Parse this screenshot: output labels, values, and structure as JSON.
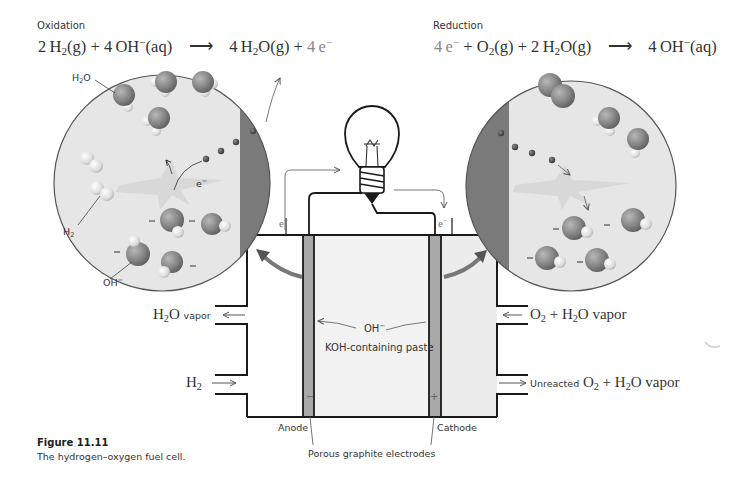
{
  "figure": {
    "number": "Figure 11.11",
    "caption": "The hydrogen–oxygen fuel cell."
  },
  "oxidation": {
    "label": "Oxidation",
    "equation": {
      "reactants": [
        "2 H₂(g)",
        "4 OH⁻(aq)"
      ],
      "products": [
        "4 H₂O(g)",
        "4 e⁻"
      ],
      "arrow": "⟶"
    }
  },
  "reduction": {
    "label": "Reduction",
    "equation": {
      "reactants": [
        "4 e⁻",
        "O₂(g)",
        "2 H₂O(g)"
      ],
      "products": [
        "4 OH⁻(aq)"
      ],
      "arrow": "⟶"
    }
  },
  "anode_zoom": {
    "labels": {
      "water": "H2O",
      "hydrogen": "H2",
      "hydroxide": "OH−",
      "electron": "e−"
    }
  },
  "cathode_zoom": {
    "labels": {}
  },
  "cell": {
    "paste_label": "KOH-containing paste",
    "ion_label": "OH−",
    "anode_label": "Anode",
    "cathode_label": "Cathode",
    "electrodes_label": "Porous graphite electrodes",
    "anode_sign": "−",
    "cathode_sign": "+",
    "electron_left": "e−",
    "electron_right": "e−",
    "left_outlet": {
      "formula": "H2O",
      "suffix": "vapor"
    },
    "left_inlet": {
      "formula": "H2"
    },
    "right_inlet": {
      "text": "O2 + H2O vapor"
    },
    "right_outlet": {
      "prefix": "Unreacted",
      "text": "O2 + H2O vapor"
    }
  },
  "colors": {
    "electrode": "#a9a9a9",
    "paste": "#f1f1f1",
    "cathode_chamber": "#ececec",
    "circle_fill": "#e6e6e6",
    "circle_electrode": "#7a7a7a",
    "oxygen_atom": "#8c8c8c",
    "hydrogen_atom": "#dcdcdc",
    "outline": "#1a1a1a"
  }
}
